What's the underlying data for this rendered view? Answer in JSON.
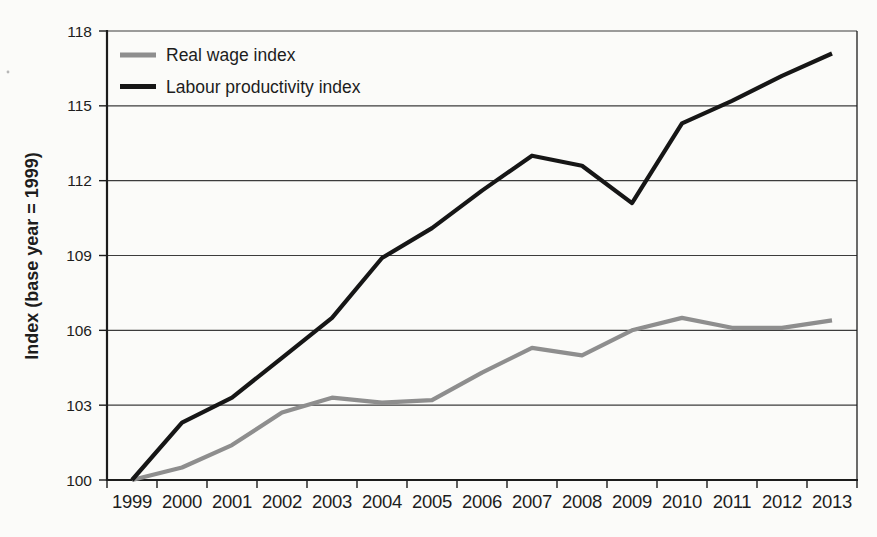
{
  "figure": {
    "background": "#fbfbf9"
  },
  "chart_data": {
    "type": "line",
    "title": "",
    "xlabel": "",
    "ylabel": "Index (base year = 1999)",
    "ylim": [
      100,
      118
    ],
    "yticks": [
      100,
      103,
      106,
      109,
      112,
      115,
      118
    ],
    "grid": true,
    "legend_position": "top-left-inside",
    "categories": [
      "1999",
      "2000",
      "2001",
      "2002",
      "2003",
      "2004",
      "2005",
      "2006",
      "2007",
      "2008",
      "2009",
      "2010",
      "2011",
      "2012",
      "2013"
    ],
    "series": [
      {
        "name": "Real wage index",
        "color": "#8e8e8e",
        "values": [
          100,
          100.5,
          101.4,
          102.7,
          103.3,
          103.1,
          103.2,
          104.3,
          105.3,
          105.0,
          106.0,
          106.5,
          106.1,
          106.1,
          106.4
        ]
      },
      {
        "name": "Labour productivity index",
        "color": "#161616",
        "values": [
          100,
          102.3,
          103.3,
          104.9,
          106.5,
          108.9,
          110.1,
          111.6,
          113.0,
          112.6,
          111.1,
          114.3,
          115.2,
          116.2,
          117.1
        ]
      }
    ],
    "colors": {
      "axis": "#1c1c1c",
      "grid": "#3c3c3c",
      "text": "#1d1d1d"
    }
  }
}
